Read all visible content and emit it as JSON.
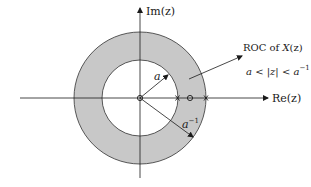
{
  "diagram": {
    "type": "z-plane region of convergence",
    "axes": {
      "real_label": "Re(z)",
      "imag_label": "Im(z)"
    },
    "annulus": {
      "inner_radius_label": "a",
      "outer_radius_label": "a",
      "outer_radius_exponent": "−1",
      "fill_color": "#c8c8c8"
    },
    "roc": {
      "title_prefix": "ROC of ",
      "title_fn": "X",
      "title_suffix": "(z)",
      "inequality_left": "a < |z| < a",
      "inequality_exponent": "−1"
    },
    "markers": [
      {
        "kind": "zero",
        "position": "origin"
      },
      {
        "kind": "pole",
        "position": "z = a"
      },
      {
        "kind": "zero",
        "position": "between a and a^-1"
      },
      {
        "kind": "pole",
        "position": "z = a^-1"
      }
    ]
  }
}
